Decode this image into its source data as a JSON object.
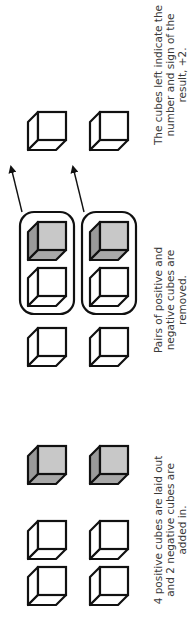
{
  "colors": {
    "positive_fill": "#ffffff",
    "negative_front": "#c8c8c8",
    "negative_side": "#9a9a9a",
    "negative_bottom": "#a8a8a8",
    "stroke": "#111111",
    "text": "#3a3a3a"
  },
  "legend": {
    "positive": "positive cube (white)",
    "negative": "negative cube (shaded)"
  },
  "steps": [
    {
      "id": "step1",
      "caption_lines": [
        "4 positive cubes are laid out",
        "and 2 negative cubes are",
        "added in."
      ],
      "positive_count": 4,
      "negative_count": 2
    },
    {
      "id": "step2",
      "caption_lines": [
        "Pairs of positive and",
        "negative cubes are",
        "removed."
      ],
      "remaining_positive": 2,
      "zero_pairs": 2
    },
    {
      "id": "step3",
      "caption_lines": [
        "The cubes left indicate the",
        "number and sign of the",
        "result, +2."
      ],
      "result_positive": 2,
      "result_value": "+2"
    }
  ]
}
